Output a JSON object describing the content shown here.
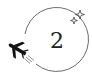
{
  "badge": {
    "number": "2",
    "icons": {
      "plane": "airplane-icon",
      "sparkles": "sparkle-icon"
    },
    "colors": {
      "stroke": "#6b6b6b",
      "plane": "#111111",
      "text": "#222222",
      "background": "#ffffff"
    }
  }
}
